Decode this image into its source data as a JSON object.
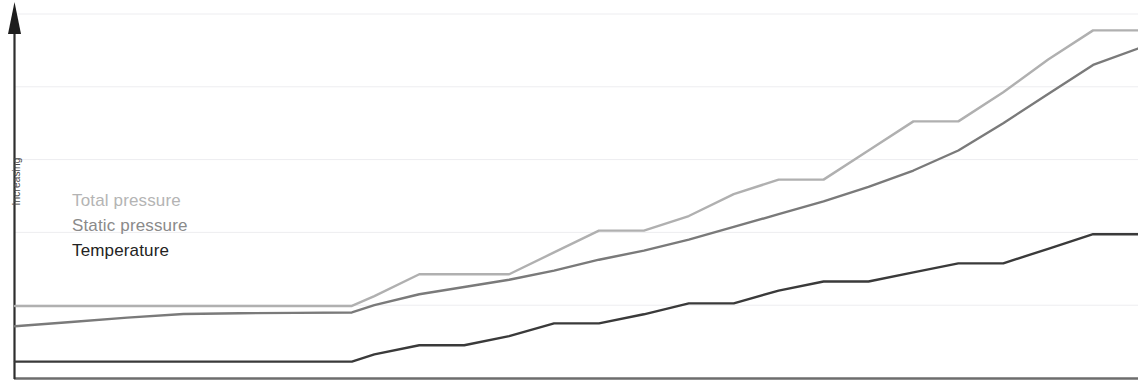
{
  "chart_data": {
    "type": "line",
    "title": "",
    "subtitle": "",
    "xlabel": "",
    "ylabel": "Increasing",
    "grid": true,
    "gridlines_y": [
      0.2,
      0.4,
      0.6,
      0.8,
      1.0
    ],
    "legend_position": "inside-left",
    "axes": {
      "y_arrow": true,
      "y_tick_labels": [],
      "x_tick_labels": [],
      "xlim": [
        0,
        100
      ],
      "ylim": [
        0,
        100
      ]
    },
    "x": [
      0,
      5,
      10,
      15,
      20,
      25,
      30,
      32,
      36,
      40,
      44,
      48,
      52,
      56,
      60,
      64,
      68,
      72,
      76,
      80,
      84,
      88,
      92,
      96,
      100
    ],
    "series": [
      {
        "name": "Total pressure",
        "color": "#b0b0b0",
        "values": [
          19.8,
          19.8,
          19.8,
          19.8,
          19.8,
          19.8,
          19.8,
          22.5,
          28.5,
          28.5,
          28.5,
          34.5,
          40.5,
          40.5,
          44.5,
          50.5,
          54.5,
          54.5,
          62.5,
          70.5,
          70.5,
          78.5,
          87.5,
          95.5,
          95.5
        ]
      },
      {
        "name": "Static pressure",
        "color": "#7a7a7a",
        "values": [
          14.2,
          15.4,
          16.6,
          17.6,
          17.8,
          17.9,
          18.0,
          20.0,
          23.0,
          25.0,
          27.0,
          29.5,
          32.5,
          35.0,
          38.0,
          41.5,
          45.0,
          48.5,
          52.5,
          57.0,
          62.5,
          70.0,
          78.0,
          86.0,
          90.5
        ]
      },
      {
        "name": "Temperature",
        "color": "#3a3a3a",
        "values": [
          4.5,
          4.5,
          4.5,
          4.5,
          4.5,
          4.5,
          4.5,
          6.5,
          9.0,
          9.0,
          11.5,
          15.0,
          15.0,
          17.5,
          20.5,
          20.5,
          24.0,
          26.5,
          26.5,
          29.0,
          31.5,
          31.5,
          35.5,
          39.5,
          39.5
        ]
      }
    ]
  },
  "legend": {
    "items": [
      {
        "label": "Total pressure",
        "color": "#b0b0b0"
      },
      {
        "label": "Static pressure",
        "color": "#7a7a7a"
      },
      {
        "label": "Temperature",
        "color": "#3a3a3a"
      }
    ]
  },
  "axis": {
    "y_label": "Increasing"
  }
}
